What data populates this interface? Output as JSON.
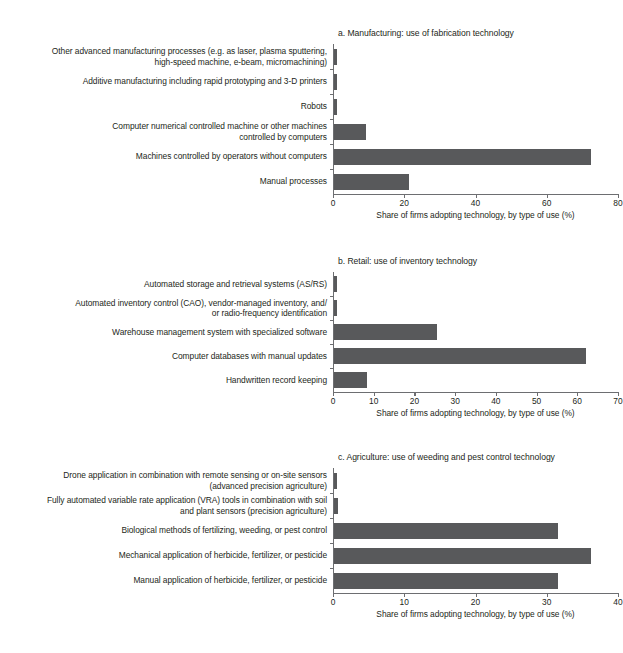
{
  "figure": {
    "axis_title": "Share of firms adopting technology, by type of use (%)",
    "bar_color": "#58595b",
    "axis_color": "#6d6e71",
    "text_color": "#231f20"
  },
  "chart_data": [
    {
      "type": "bar",
      "orientation": "horizontal",
      "title": "a. Manufacturing: use of fabrication technology",
      "xlabel": "Share of firms adopting technology, by type of use (%)",
      "ylabel": "",
      "xlim": [
        0,
        80
      ],
      "xticks": [
        0,
        20,
        40,
        60,
        80
      ],
      "xticklabels": [
        "0",
        "20",
        "40",
        "60",
        "80"
      ],
      "grid": false,
      "legend": "none",
      "categories": [
        "Other advanced manufacturing processes (e.g. as laser, plasma sputtering, high-speed machine, e-beam, micromachining)",
        "Additive manufacturing including rapid prototyping and 3-D printers",
        "Robots",
        "Computer numerical controlled machine or other machines controlled by computers",
        "Machines controlled by operators without computers",
        "Manual processes"
      ],
      "category_lines": [
        [
          "Other advanced manufacturing processes (e.g. as laser, plasma sputtering,",
          "high-speed machine, e-beam, micromachining)"
        ],
        [
          "Additive manufacturing including rapid prototyping and 3-D printers"
        ],
        [
          "Robots"
        ],
        [
          "Computer numerical controlled machine or other machines",
          "controlled by computers"
        ],
        [
          "Machines controlled by operators without computers"
        ],
        [
          "Manual processes"
        ]
      ],
      "values": [
        0.9,
        0.9,
        0.9,
        9.0,
        72.0,
        21.0
      ]
    },
    {
      "type": "bar",
      "orientation": "horizontal",
      "title": "b. Retail: use of inventory technology",
      "xlabel": "Share of firms adopting technology, by type of use (%)",
      "ylabel": "",
      "xlim": [
        0,
        70
      ],
      "xticks": [
        0,
        10,
        20,
        30,
        40,
        50,
        60,
        70
      ],
      "xticklabels": [
        "0",
        "10",
        "20",
        "30",
        "40",
        "50",
        "60",
        "70"
      ],
      "grid": false,
      "legend": "none",
      "categories": [
        "Automated storage and retrieval systems (AS/RS)",
        "Automated inventory control (CAO), vendor-managed inventory, and/ or radio-frequency identification",
        "Warehouse management system with specialized software",
        "Computer databases with manual updates",
        "Handwritten record keeping"
      ],
      "category_lines": [
        [
          "Automated storage and retrieval systems (AS/RS)"
        ],
        [
          "Automated inventory control (CAO), vendor-managed inventory, and/",
          "or radio-frequency identification"
        ],
        [
          "Warehouse management system with specialized software"
        ],
        [
          "Computer databases with manual updates"
        ],
        [
          "Handwritten record keeping"
        ]
      ],
      "values": [
        0.8,
        0.8,
        25.3,
        62.0,
        8.0
      ]
    },
    {
      "type": "bar",
      "orientation": "horizontal",
      "title": "c. Agriculture: use of weeding and pest control technology",
      "xlabel": "Share of firms adopting technology, by type of use (%)",
      "ylabel": "",
      "xlim": [
        0,
        40
      ],
      "xticks": [
        0,
        10,
        20,
        30,
        40
      ],
      "xticklabels": [
        "0",
        "10",
        "20",
        "30",
        "40"
      ],
      "grid": false,
      "legend": "none",
      "categories": [
        "Drone application in combination with remote sensing or on-site sensors (advanced precision agriculture)",
        "Fully automated variable rate application (VRA) tools in combination with soil and plant sensors (precision agriculture)",
        "Biological methods of fertilizing, weeding, or pest control",
        "Mechanical application of herbicide, fertilizer, or pesticide",
        "Manual application of herbicide, fertilizer, or pesticide"
      ],
      "category_lines": [
        [
          "Drone application in combination with remote sensing or on-site sensors",
          "(advanced precision agriculture)"
        ],
        [
          "Fully automated variable rate application (VRA) tools in combination with soil",
          "and plant sensors (precision agriculture)"
        ],
        [
          "Biological methods of fertilizing, weeding, or pest control"
        ],
        [
          "Mechanical application of herbicide, fertilizer, or pesticide"
        ],
        [
          "Manual application of herbicide, fertilizer, or pesticide"
        ]
      ],
      "values": [
        0.45,
        0.5,
        31.5,
        36.0,
        31.5
      ]
    }
  ]
}
